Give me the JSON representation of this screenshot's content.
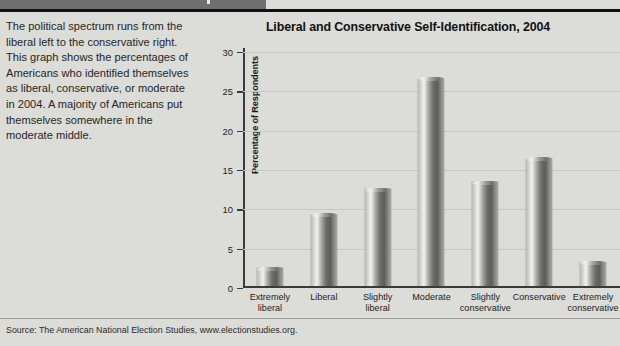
{
  "caption": {
    "text": "The political spectrum runs from the liberal left to the conservative right. This graph shows the percentages of Americans who identified themselves as liberal, conservative, or moderate in 2004. A majority of Americans put themselves somewhere in the moderate middle."
  },
  "footer": {
    "source": "Source: The American National Election Studies, www.electionstudies.org."
  },
  "colors": {
    "page_background": "#dcdcd8",
    "rule": "#111111",
    "bar_light": "#f2f2f0",
    "bar_dark": "#5c5c59",
    "axis": "#3a3a3a",
    "gridline": "#c6c6c2"
  },
  "chart_data": {
    "type": "bar",
    "title": "Liberal and Conservative Self-Identification, 2004",
    "xlabel": "",
    "ylabel": "Percentage of Respondents",
    "ylim": [
      0,
      30
    ],
    "yticks": [
      0,
      5,
      10,
      15,
      20,
      25,
      30
    ],
    "ytick_labels": [
      "0",
      "5",
      "10",
      "15",
      "20",
      "25",
      "30"
    ],
    "grid": true,
    "legend": "none",
    "categories": [
      "Extremely liberal",
      "Liberal",
      "Slightly liberal",
      "Moderate",
      "Slightly conservative",
      "Conservative",
      "Extremely conservative"
    ],
    "category_lines": [
      [
        "Extremely",
        "liberal"
      ],
      [
        "Liberal",
        ""
      ],
      [
        "Slightly",
        "liberal"
      ],
      [
        "Moderate",
        ""
      ],
      [
        "Slightly",
        "conservative"
      ],
      [
        "Conservative",
        ""
      ],
      [
        "Extremely",
        "conservative"
      ]
    ],
    "values": [
      2.2,
      9.0,
      12.2,
      26.3,
      13.1,
      16.1,
      2.9
    ],
    "units": "percent"
  }
}
